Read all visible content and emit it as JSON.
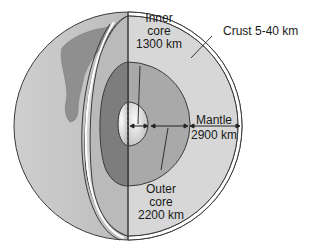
{
  "diagram": {
    "layers": {
      "crust": {
        "label": "Crust 5-40 km",
        "name": "Crust",
        "thickness": "5-40 km"
      },
      "mantle": {
        "label_line1": "Mantle",
        "label_line2": "2900 km",
        "name": "Mantle",
        "thickness": "2900 km"
      },
      "outer_core": {
        "label_line1": "Outer",
        "label_line2": "core",
        "label_line3": "2200 km",
        "name": "Outer core",
        "thickness": "2200 km"
      },
      "inner_core": {
        "label_line1": "Inner",
        "label_line2": "core",
        "label_line3": "1300 km",
        "name": "Inner core",
        "thickness": "1300 km"
      }
    },
    "colors": {
      "globe_surface": "#b4b4b4",
      "continent": "#8a8a8a",
      "mantle": "#d6d6d6",
      "outer_core": "#a8a8a8",
      "outer_core_dark": "#7c7c7c",
      "inner_core": "#eeeeee",
      "outline": "#3a3a3a"
    }
  }
}
